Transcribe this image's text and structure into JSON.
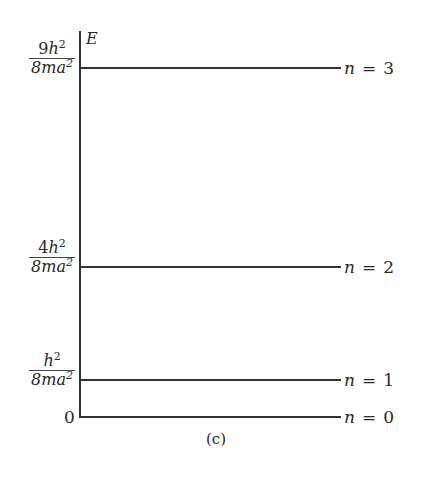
{
  "diagram": {
    "axis_label": "E",
    "caption": "(c)",
    "zero_label": "0",
    "levels": [
      {
        "n_label": "n",
        "eq": "=",
        "n_value": "3",
        "energy_coef": "9",
        "energy_num_var": "h",
        "energy_num_exp": "2",
        "energy_den": "8ma",
        "energy_den_exp": "2"
      },
      {
        "n_label": "n",
        "eq": "=",
        "n_value": "2",
        "energy_coef": "4",
        "energy_num_var": "h",
        "energy_num_exp": "2",
        "energy_den": "8ma",
        "energy_den_exp": "2"
      },
      {
        "n_label": "n",
        "eq": "=",
        "n_value": "1",
        "energy_coef": "",
        "energy_num_var": "h",
        "energy_num_exp": "2",
        "energy_den": "8ma",
        "energy_den_exp": "2"
      },
      {
        "n_label": "n",
        "eq": "=",
        "n_value": "0",
        "energy": "0"
      }
    ]
  }
}
